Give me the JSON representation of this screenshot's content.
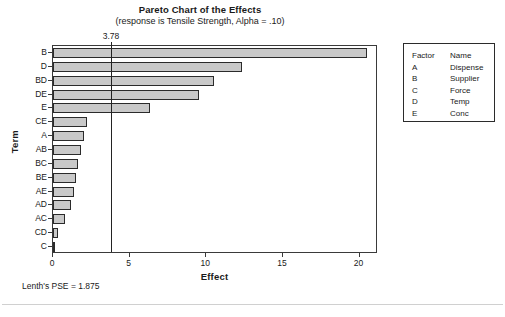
{
  "chart_data": {
    "type": "bar",
    "orientation": "horizontal",
    "title": "Pareto Chart of the Effects",
    "subtitle": "(response is Tensile Strength, Alpha = .10)",
    "xlabel": "Effect",
    "ylabel": "Term",
    "xlim": [
      0,
      21.2
    ],
    "xticks": [
      0,
      5,
      10,
      15,
      20
    ],
    "xtick_labels": [
      "0",
      "5",
      "10",
      "15",
      "20"
    ],
    "grid": false,
    "legend_position": "right-outside",
    "categories": [
      "B",
      "D",
      "BD",
      "DE",
      "E",
      "CE",
      "A",
      "AB",
      "BC",
      "BE",
      "AE",
      "AD",
      "AC",
      "CD",
      "C"
    ],
    "values": [
      20.5,
      12.3,
      10.5,
      9.5,
      6.3,
      2.2,
      2.0,
      1.8,
      1.6,
      1.5,
      1.4,
      1.2,
      0.8,
      0.3,
      0.05
    ],
    "reference_line": {
      "value": 3.78,
      "label": "3.78"
    },
    "annotations": [
      "Lenth's PSE = 1.875"
    ],
    "bar_fill_color": "#c9c9c9",
    "bar_border_color": "#2b2b2b",
    "reference_line_color": "#232323"
  },
  "legend": {
    "header": {
      "factor": "Factor",
      "name": "Name"
    },
    "rows": [
      {
        "factor": "A",
        "name": "Dispense"
      },
      {
        "factor": "B",
        "name": "Supplier"
      },
      {
        "factor": "C",
        "name": "Force"
      },
      {
        "factor": "D",
        "name": "Temp"
      },
      {
        "factor": "E",
        "name": "Conc"
      }
    ]
  },
  "footnote": {
    "pse_text": "Lenth's PSE = 1.875"
  }
}
